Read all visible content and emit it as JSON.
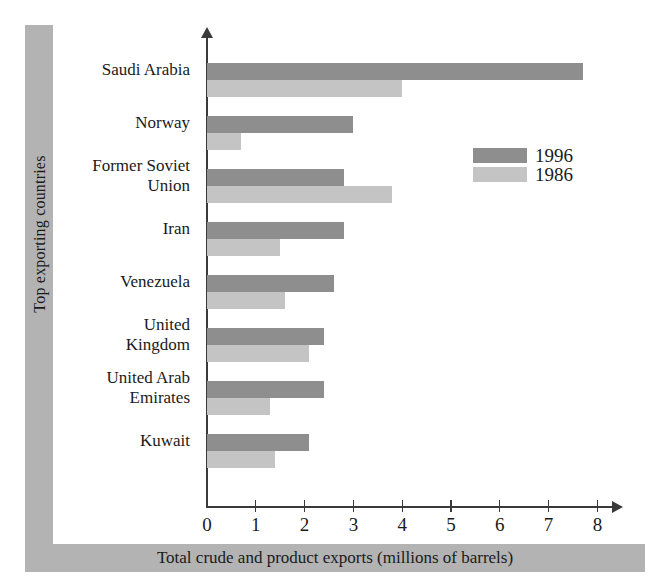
{
  "chart_data": {
    "type": "bar",
    "orientation": "horizontal",
    "title": "",
    "xlabel": "Total crude and product exports (millions of barrels)",
    "ylabel": "Top exporting countries",
    "categories": [
      "Saudi Arabia",
      "Norway",
      "Former Soviet Union",
      "Iran",
      "Venezuela",
      "United Kingdom",
      "United Arab Emirates",
      "Kuwait"
    ],
    "series": [
      {
        "name": "1996",
        "color": "#8e8e8e",
        "values": [
          7.7,
          3.0,
          2.8,
          2.8,
          2.6,
          2.4,
          2.4,
          2.1
        ]
      },
      {
        "name": "1986",
        "color": "#c4c4c4",
        "values": [
          4.0,
          0.7,
          3.8,
          1.5,
          1.6,
          2.1,
          1.3,
          1.4
        ]
      }
    ],
    "xlim": [
      0,
      8
    ],
    "xticks": [
      0,
      1,
      2,
      3,
      4,
      5,
      6,
      7,
      8
    ],
    "xtick_labels": [
      "0",
      "1",
      "2",
      "3",
      "4",
      "5",
      "6",
      "7",
      "8"
    ],
    "grid": false,
    "legend_position": "upper right",
    "legend_entries": [
      "1996",
      "1986"
    ]
  },
  "axis": {
    "x_title": "Total crude and product exports (millions of barrels)",
    "y_title": "Top exporting countries"
  },
  "legend": {
    "items": [
      {
        "label": "1996"
      },
      {
        "label": "1986"
      }
    ]
  },
  "categories": [
    {
      "lines": [
        "Saudi Arabia"
      ]
    },
    {
      "lines": [
        "Norway"
      ]
    },
    {
      "lines": [
        "Former Soviet",
        "Union"
      ]
    },
    {
      "lines": [
        "Iran"
      ]
    },
    {
      "lines": [
        "Venezuela"
      ]
    },
    {
      "lines": [
        "United",
        "Kingdom"
      ]
    },
    {
      "lines": [
        "United Arab",
        "Emirates"
      ]
    },
    {
      "lines": [
        "Kuwait"
      ]
    }
  ]
}
